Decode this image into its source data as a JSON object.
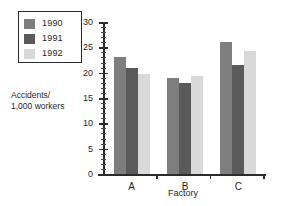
{
  "chart_data": {
    "type": "bar",
    "title": "",
    "xlabel": "Factory",
    "ylabel": "Accidents/\n1,000 workers",
    "categories": [
      "A",
      "B",
      "C"
    ],
    "series": [
      {
        "name": "1990",
        "color": "#7e7e7e",
        "values": [
          23.0,
          19.0,
          26.1
        ]
      },
      {
        "name": "1991",
        "color": "#5a5a5a",
        "values": [
          21.0,
          18.0,
          21.5
        ]
      },
      {
        "name": "1992",
        "color": "#d9d9d9",
        "values": [
          19.8,
          19.3,
          24.3
        ]
      }
    ],
    "ylim": [
      0,
      30
    ],
    "ytick_labels": [
      "0",
      "5",
      "10",
      "15",
      "20",
      "25",
      "30"
    ],
    "ytick_values": [
      0,
      5,
      10,
      15,
      20,
      25,
      30
    ],
    "yminor_step": 1,
    "grid": false,
    "legend_position": "upper-left-outside"
  },
  "axis": {
    "y_title_line1": "Accidents/",
    "y_title_line2": "1,000 workers",
    "x_title": "Factory"
  },
  "legend": {
    "entries": [
      {
        "label": "1990",
        "color": "#7e7e7e"
      },
      {
        "label": "1991",
        "color": "#5a5a5a"
      },
      {
        "label": "1992",
        "color": "#d9d9d9"
      }
    ]
  },
  "colors": {
    "axis": "#2b2b2b",
    "background": "#ffffff",
    "text": "#1f1f1f"
  }
}
